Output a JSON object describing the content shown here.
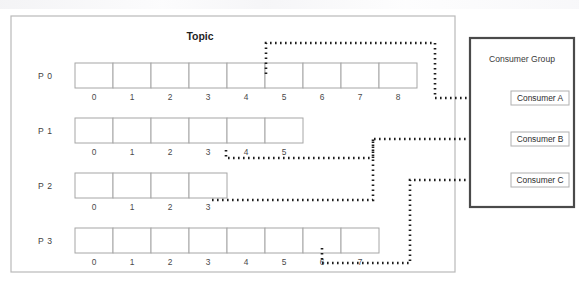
{
  "canvas": {
    "width": 579,
    "height": 287,
    "background": "#ffffff"
  },
  "topic": {
    "title": "Topic",
    "frame": {
      "x": 11,
      "y": 16,
      "width": 444,
      "height": 256
    },
    "partitions": [
      {
        "name": "P 0",
        "offsets": [
          "0",
          "1",
          "2",
          "3",
          "4",
          "5",
          "6",
          "7",
          "8"
        ],
        "cell_count": 9,
        "assigned_to": "Consumer A",
        "branch_offset_index": 5
      },
      {
        "name": "P 1",
        "offsets": [
          "0",
          "1",
          "2",
          "3",
          "4",
          "5"
        ],
        "cell_count": 6,
        "assigned_to": "Consumer B",
        "branch_offset_index": 5
      },
      {
        "name": "P 2",
        "offsets": [
          "0",
          "1",
          "2",
          "3"
        ],
        "cell_count": 4,
        "assigned_to": "Consumer B",
        "branch_offset_index": 4
      },
      {
        "name": "P 3",
        "offsets": [
          "0",
          "1",
          "2",
          "3",
          "4",
          "5",
          "6",
          "7"
        ],
        "cell_count": 8,
        "assigned_to": "Consumer C",
        "branch_offset_index": 7
      }
    ]
  },
  "consumer_group": {
    "title": "Consumer Group",
    "frame": {
      "x": 470,
      "y": 38,
      "width": 104,
      "height": 169
    },
    "consumers": [
      {
        "label": "Consumer A",
        "y": 98
      },
      {
        "label": "Consumer B",
        "y": 139
      },
      {
        "label": "Consumer C",
        "y": 180
      }
    ]
  },
  "colors": {
    "frame_stroke": "#b9b9b9",
    "group_stroke": "#4a4a4a",
    "cell_stroke": "#a6a6a6",
    "connector": "#1c1c1c",
    "text": "#3f3f3f",
    "background": "#ffffff"
  },
  "connectors": [
    {
      "name": "p0-to-consumer-a",
      "from": "P 0",
      "to": "Consumer A",
      "style": "dotted"
    },
    {
      "name": "p1-to-consumer-b",
      "from": "P 1",
      "to": "Consumer B",
      "style": "dotted"
    },
    {
      "name": "p2-to-consumer-b",
      "from": "P 2",
      "to": "Consumer B",
      "style": "dotted"
    },
    {
      "name": "p3-to-consumer-c",
      "from": "P 3",
      "to": "Consumer C",
      "style": "dotted"
    }
  ]
}
